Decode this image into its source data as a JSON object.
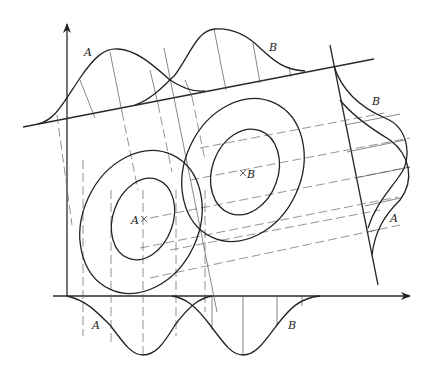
{
  "figure": {
    "labels": {
      "top_A": "A",
      "top_B": "B",
      "right_B": "B",
      "right_A": "A",
      "center_A": "A",
      "center_B": "B",
      "bottom_A": "A",
      "bottom_B": "B"
    },
    "center_marker": "×",
    "distributions": [
      {
        "name": "A",
        "center": [
          143,
          220
        ],
        "contours": 2
      },
      {
        "name": "B",
        "center": [
          243,
          172
        ],
        "contours": 2
      }
    ],
    "projections": [
      "bottom horizontal axis",
      "upper tilted axis",
      "right tilted axis"
    ]
  }
}
